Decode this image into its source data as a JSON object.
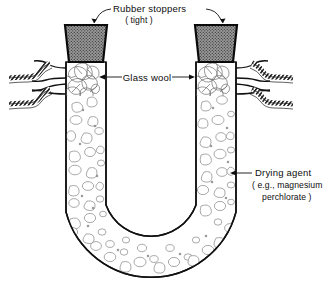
{
  "figure": {
    "background_color": "#ffffff",
    "ink_color": "#0d0d0d",
    "width": 328,
    "height": 283
  },
  "labels": {
    "stoppers": {
      "line1": "Rubber stoppers",
      "line2": "( tight )"
    },
    "glass_wool": {
      "line1": "Glass wool"
    },
    "drying_agent": {
      "line1": "Drying agent",
      "line2": "( e.g., magnesium",
      "line3": "perchlorate )"
    }
  },
  "parts": {
    "stopper_left": "rubber-stopper-left",
    "stopper_right": "rubber-stopper-right",
    "wool_left": "glass-wool-plug-left",
    "wool_right": "glass-wool-plug-right",
    "tube_body": "u-tube-glass-body",
    "fill": "drying-agent-granules",
    "tubing_upper_left": "rubber-tubing-upper-left",
    "tubing_lower_left": "rubber-tubing-lower-left",
    "tubing_upper_right": "rubber-tubing-upper-right",
    "tubing_lower_right": "rubber-tubing-lower-right"
  },
  "colors": {
    "stopper_fill": "#8a8a8a",
    "granule_stroke": "#8e8e8e",
    "glass_stroke": "#111111",
    "paper": "#ffffff"
  }
}
